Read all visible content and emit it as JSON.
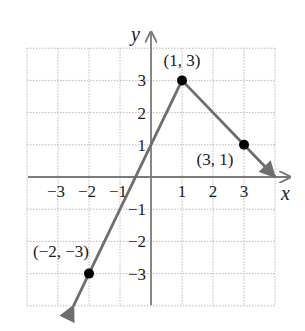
{
  "chart_data": {
    "type": "line",
    "title": "",
    "xlabel": "x",
    "ylabel": "y",
    "xlim": [
      -4,
      4
    ],
    "ylim": [
      -4,
      4
    ],
    "grid": true,
    "x_ticks": [
      "−3",
      "−2",
      "−1",
      "1",
      "2",
      "3"
    ],
    "y_ticks": [
      "3",
      "2",
      "1",
      "−1",
      "−2",
      "−3"
    ],
    "x_tick_values": [
      -3,
      -2,
      -1,
      1,
      2,
      3
    ],
    "y_tick_values": [
      3,
      2,
      1,
      -1,
      -2,
      -3
    ],
    "series": [
      {
        "name": "piecewise linear graph",
        "points": [
          [
            -2.5,
            -4
          ],
          [
            -2,
            -3
          ],
          [
            1,
            3
          ],
          [
            3,
            1
          ],
          [
            4,
            0
          ]
        ],
        "arrows": "both ends"
      }
    ],
    "labeled_points": [
      {
        "x": 1,
        "y": 3,
        "label": "(1, 3)"
      },
      {
        "x": 3,
        "y": 1,
        "label": "(3, 1)"
      },
      {
        "x": -2,
        "y": -3,
        "label": "(−2, −3)"
      }
    ]
  },
  "colors": {
    "grid": "#b8b8b8",
    "axes": "#7a7a7a",
    "line": "#6e6e6e",
    "point": "#000000",
    "text": "#1a1a1a"
  }
}
